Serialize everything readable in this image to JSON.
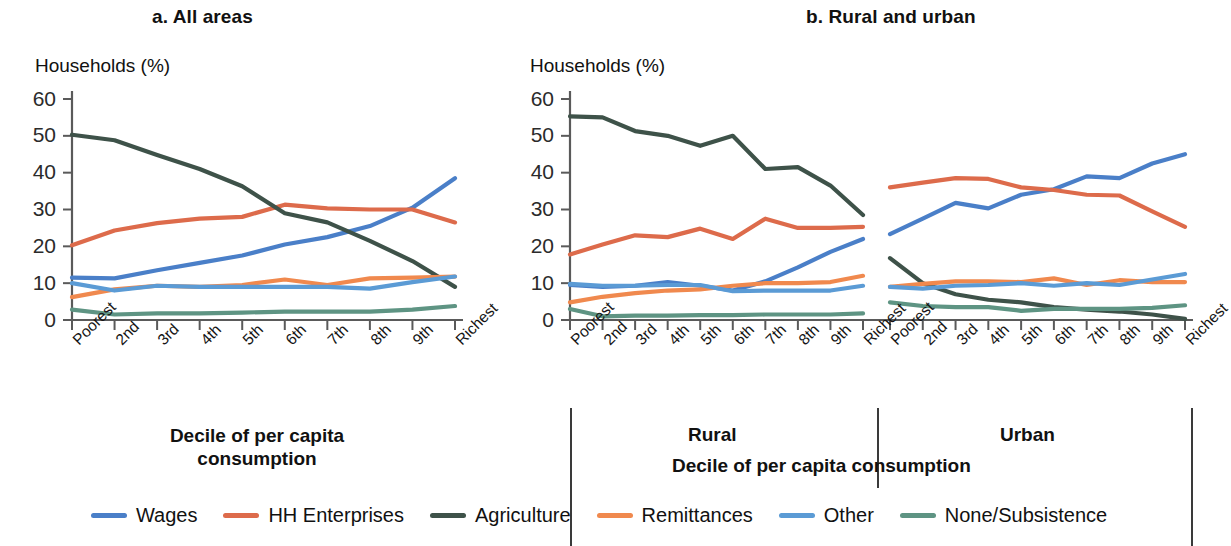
{
  "figure": {
    "panel_a_title": "a. All areas",
    "panel_b_title": "b. Rural and urban",
    "y_axis_label": "Households (%)",
    "x_axis_caption_a": "Decile of per capita consumption",
    "x_axis_caption_b": "Decile of per capita consumption",
    "group_rural": "Rural",
    "group_urban": "Urban"
  },
  "legend": {
    "items": [
      {
        "label": "Wages",
        "color": "#4a7fc8"
      },
      {
        "label": "HH Enterprises",
        "color": "#dd6b4b"
      },
      {
        "label": "Agriculture",
        "color": "#3e5249"
      },
      {
        "label": "Remittances",
        "color": "#f0894e"
      },
      {
        "label": "Other",
        "color": "#5b9bd5"
      },
      {
        "label": "None/Subsistence",
        "color": "#5e9483"
      }
    ]
  },
  "chart_data": [
    {
      "type": "line",
      "title": "a. All areas",
      "xlabel": "Decile of per capita consumption",
      "ylabel": "Households (%)",
      "ylim": [
        0,
        60
      ],
      "yticks": [
        0,
        10,
        20,
        30,
        40,
        50,
        60
      ],
      "grid": false,
      "legend_position": "bottom",
      "categories": [
        "Poorest",
        "2nd",
        "3rd",
        "4th",
        "5th",
        "6th",
        "7th",
        "8th",
        "9th",
        "Richest"
      ],
      "series": [
        {
          "name": "Wages",
          "color": "#4a7fc8",
          "values": [
            11.5,
            11.3,
            13.5,
            15.5,
            17.5,
            20.5,
            22.5,
            25.5,
            30.5,
            38.5
          ]
        },
        {
          "name": "HH Enterprises",
          "color": "#dd6b4b",
          "values": [
            20.3,
            24.3,
            26.3,
            27.5,
            28.0,
            31.3,
            30.3,
            30.0,
            30.0,
            26.5
          ]
        },
        {
          "name": "Agriculture",
          "color": "#3e5249",
          "values": [
            50.3,
            48.8,
            44.8,
            41.0,
            36.3,
            29.0,
            26.5,
            21.5,
            16.0,
            9.0
          ]
        },
        {
          "name": "Remittances",
          "color": "#f0894e",
          "values": [
            6.2,
            8.3,
            9.3,
            9.0,
            9.5,
            11.0,
            9.5,
            11.3,
            11.5,
            11.8
          ]
        },
        {
          "name": "Other",
          "color": "#5b9bd5",
          "values": [
            10.0,
            8.0,
            9.3,
            9.0,
            9.0,
            9.0,
            9.0,
            8.5,
            10.3,
            11.8
          ]
        },
        {
          "name": "None/Subsistence",
          "color": "#5e9483",
          "values": [
            2.8,
            1.5,
            1.8,
            1.8,
            2.0,
            2.3,
            2.3,
            2.3,
            2.8,
            3.8
          ]
        }
      ]
    },
    {
      "type": "line",
      "title": "b. Rural and urban - Rural",
      "group": "Rural",
      "xlabel": "Decile of per capita consumption",
      "ylabel": "Households (%)",
      "ylim": [
        0,
        60
      ],
      "yticks": [
        0,
        10,
        20,
        30,
        40,
        50,
        60
      ],
      "grid": false,
      "categories": [
        "Poorest",
        "2nd",
        "3rd",
        "4th",
        "5th",
        "6th",
        "7th",
        "8th",
        "9th",
        "Richest"
      ],
      "series": [
        {
          "name": "Wages",
          "color": "#4a7fc8",
          "values": [
            9.5,
            9.0,
            9.3,
            10.3,
            9.3,
            8.0,
            10.5,
            14.3,
            18.5,
            22.0
          ]
        },
        {
          "name": "HH Enterprises",
          "color": "#dd6b4b",
          "values": [
            17.8,
            20.5,
            23.0,
            22.5,
            24.8,
            22.0,
            27.5,
            25.0,
            25.0,
            25.3
          ]
        },
        {
          "name": "Agriculture",
          "color": "#3e5249",
          "values": [
            55.3,
            55.0,
            51.3,
            50.0,
            47.3,
            50.0,
            41.0,
            41.5,
            36.5,
            28.5
          ]
        },
        {
          "name": "Remittances",
          "color": "#f0894e",
          "values": [
            4.8,
            6.3,
            7.3,
            8.0,
            8.3,
            9.3,
            10.0,
            10.0,
            10.3,
            12.0
          ]
        },
        {
          "name": "Other",
          "color": "#5b9bd5",
          "values": [
            9.8,
            9.3,
            9.3,
            9.5,
            9.5,
            7.8,
            8.0,
            8.0,
            8.0,
            9.3
          ]
        },
        {
          "name": "None/Subsistence",
          "color": "#5e9483",
          "values": [
            3.0,
            1.0,
            1.2,
            1.2,
            1.3,
            1.3,
            1.5,
            1.5,
            1.5,
            1.8
          ]
        }
      ]
    },
    {
      "type": "line",
      "title": "b. Rural and urban - Urban",
      "group": "Urban",
      "xlabel": "Decile of per capita consumption",
      "ylabel": "Households (%)",
      "ylim": [
        0,
        60
      ],
      "yticks": [
        0,
        10,
        20,
        30,
        40,
        50,
        60
      ],
      "grid": false,
      "categories": [
        "Poorest",
        "2nd",
        "3rd",
        "4th",
        "5th",
        "6th",
        "7th",
        "8th",
        "9th",
        "Richest"
      ],
      "series": [
        {
          "name": "Wages",
          "color": "#4a7fc8",
          "values": [
            23.3,
            27.5,
            31.8,
            30.3,
            34.0,
            35.5,
            39.0,
            38.5,
            42.5,
            45.0
          ]
        },
        {
          "name": "HH Enterprises",
          "color": "#dd6b4b",
          "values": [
            36.0,
            37.3,
            38.5,
            38.3,
            36.0,
            35.3,
            34.0,
            33.8,
            29.5,
            25.3
          ]
        },
        {
          "name": "Agriculture",
          "color": "#3e5249",
          "values": [
            16.8,
            10.0,
            7.0,
            5.5,
            4.8,
            3.5,
            2.8,
            2.3,
            1.5,
            0.3
          ]
        },
        {
          "name": "Remittances",
          "color": "#f0894e",
          "values": [
            9.0,
            9.8,
            10.5,
            10.5,
            10.3,
            11.3,
            9.5,
            10.8,
            10.3,
            10.3
          ]
        },
        {
          "name": "Other",
          "color": "#5b9bd5",
          "values": [
            9.0,
            8.5,
            9.3,
            9.5,
            10.0,
            9.3,
            10.0,
            9.5,
            11.0,
            12.5
          ]
        },
        {
          "name": "None/Subsistence",
          "color": "#5e9483",
          "values": [
            4.8,
            3.8,
            3.5,
            3.5,
            2.5,
            3.0,
            3.0,
            3.0,
            3.3,
            4.0
          ]
        }
      ]
    }
  ]
}
